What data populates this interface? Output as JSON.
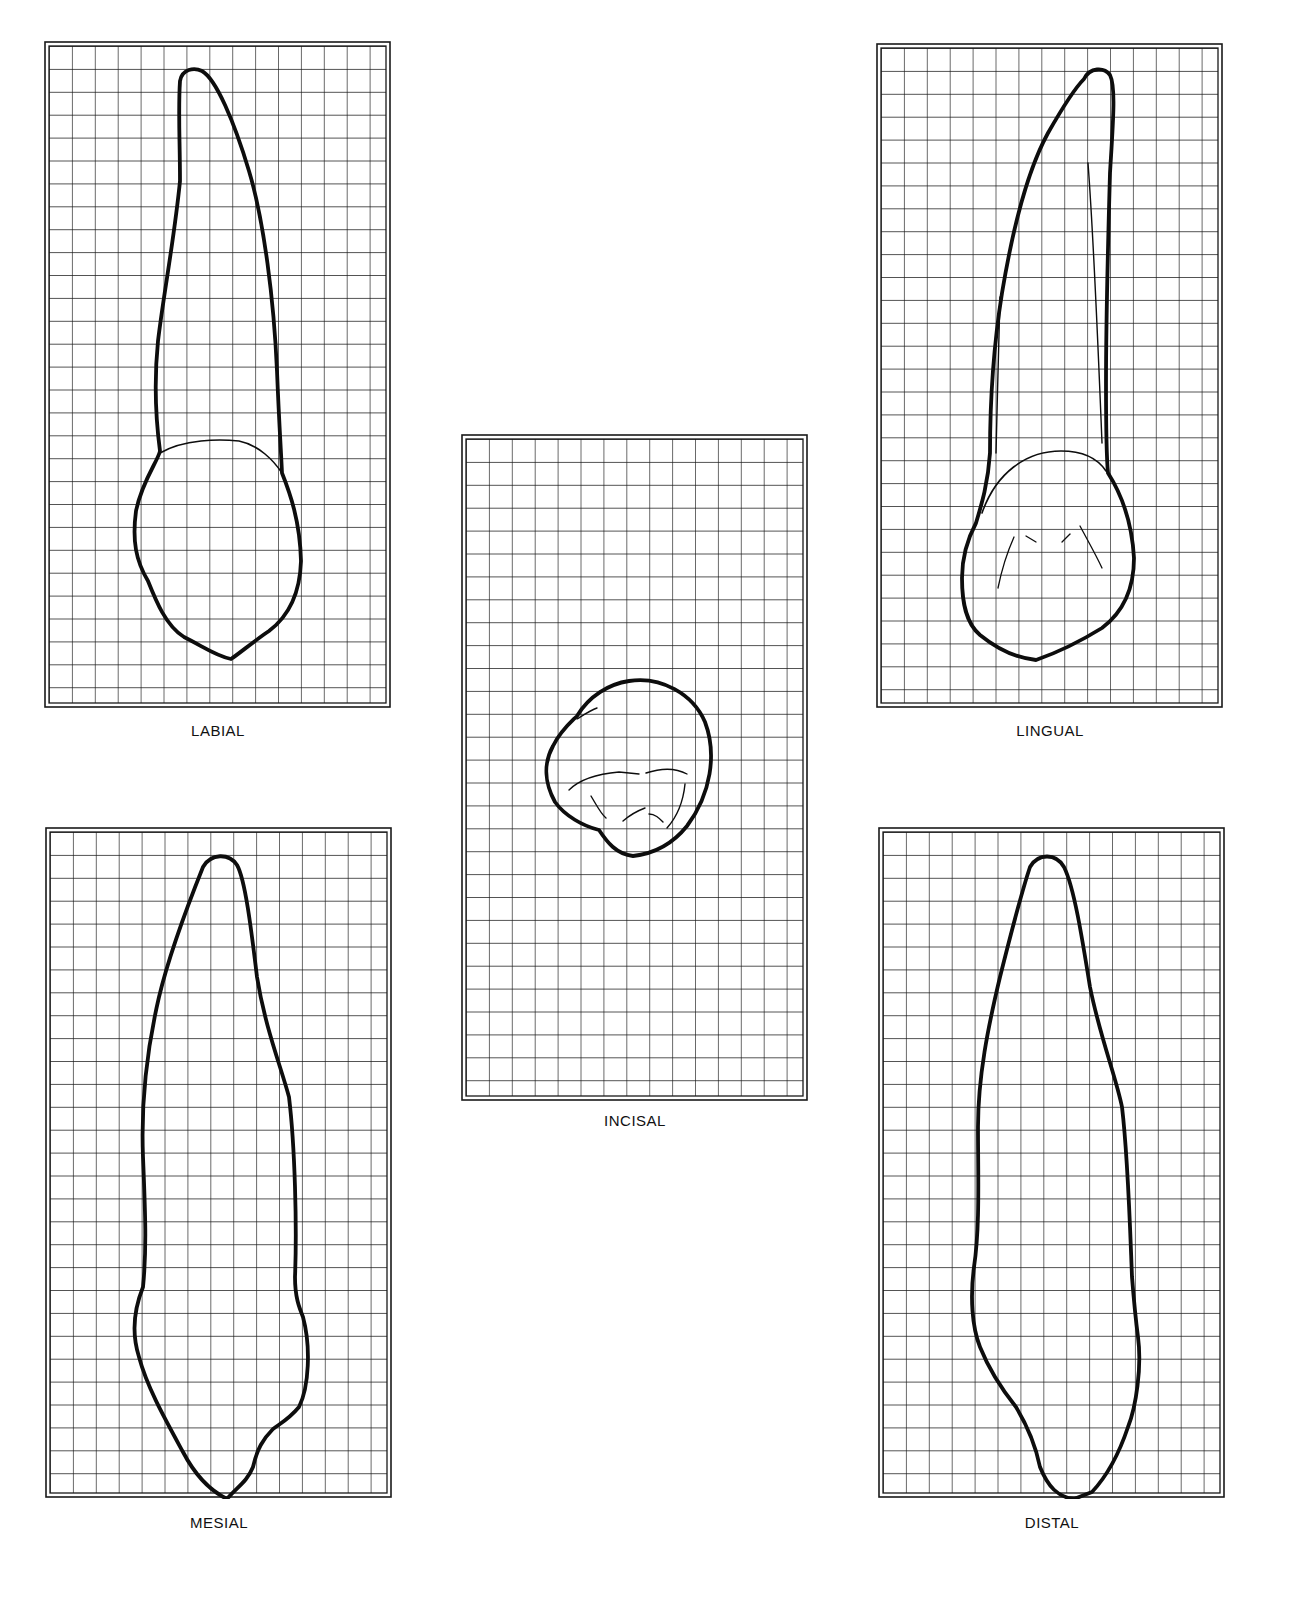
{
  "figure": {
    "type": "dental-tooth-outline-views-on-grid",
    "views": [
      {
        "id": "labial",
        "label": "LABIAL"
      },
      {
        "id": "lingual",
        "label": "LINGUAL"
      },
      {
        "id": "incisal",
        "label": "INCISAL"
      },
      {
        "id": "mesial",
        "label": "MESIAL"
      },
      {
        "id": "distal",
        "label": "DISTAL"
      }
    ]
  },
  "colors": {
    "grid_line": "#1a1a1a",
    "outline": "#0d0d0d",
    "background": "#ffffff"
  },
  "grid": {
    "columns": 15
  }
}
